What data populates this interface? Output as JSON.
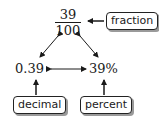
{
  "diagram": {
    "fraction": {
      "numerator": "39",
      "denominator": "100"
    },
    "decimal_value": "0.39",
    "percent_value": "39%",
    "labels": {
      "fraction": "fraction",
      "decimal": "decimal",
      "percent": "percent"
    },
    "connections": [
      {
        "from": "fraction",
        "to": "decimal",
        "type": "bidirectional"
      },
      {
        "from": "fraction",
        "to": "percent",
        "type": "bidirectional"
      },
      {
        "from": "decimal",
        "to": "percent",
        "type": "bidirectional"
      }
    ],
    "colors": {
      "ink": "#1a1a1a",
      "shadow": "#9a9a9a",
      "background": "#ffffff"
    }
  }
}
